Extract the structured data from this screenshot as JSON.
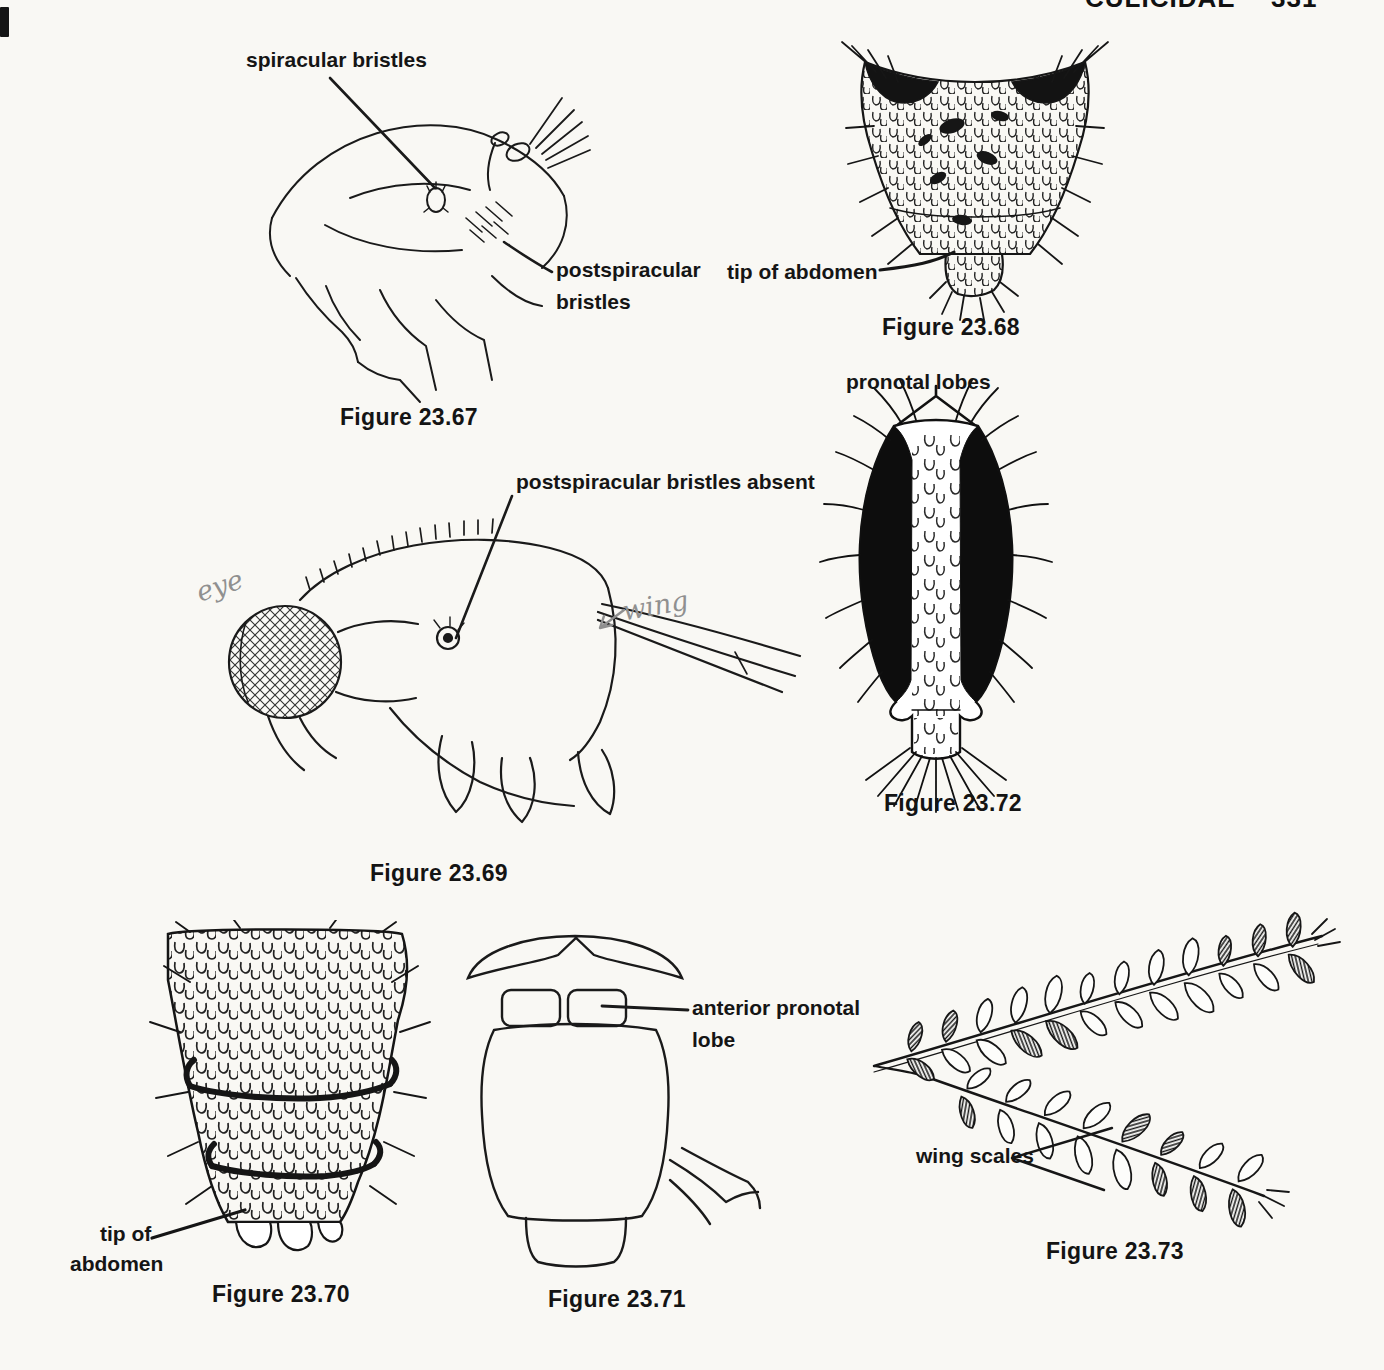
{
  "header": {
    "running_title": "CULICIDAE",
    "page_number": "331"
  },
  "figures": {
    "fig67": {
      "caption": "Figure 23.67",
      "label_spiracular": "spiracular bristles",
      "label_postspiracular_1": "postspiracular",
      "label_postspiracular_2": "bristles"
    },
    "fig68": {
      "caption": "Figure 23.68",
      "label_tip": "tip of abdomen"
    },
    "fig69": {
      "caption": "Figure 23.69",
      "label_absent": "postspiracular bristles absent",
      "handwritten_eye": "eye",
      "handwritten_wing": "wing"
    },
    "fig70": {
      "caption": "Figure 23.70",
      "label_tip_1": "tip of",
      "label_tip_2": "abdomen"
    },
    "fig71": {
      "caption": "Figure 23.71",
      "label_lobe_1": "anterior pronotal",
      "label_lobe_2": "lobe"
    },
    "fig72": {
      "caption": "Figure 23.72",
      "label_pronotal": "pronotal lobes"
    },
    "fig73": {
      "caption": "Figure 23.73",
      "label_scales": "wing scales"
    }
  }
}
